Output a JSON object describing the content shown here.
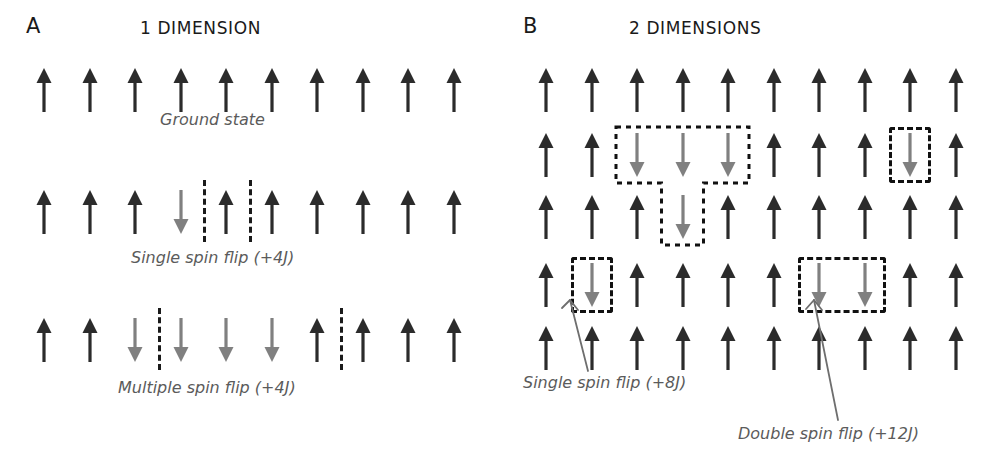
{
  "figure": {
    "type": "diagram",
    "background": "#ffffff",
    "colors": {
      "spin_up": "#2b2b2b",
      "spin_down": "#808080",
      "boundary": "#111111",
      "caption_text": "#5b5b5b",
      "title_text": "#1a1a1a",
      "leader_line": "#6e6e6e"
    }
  },
  "panels": [
    {
      "letter": "A",
      "title": "1 DIMENSION",
      "rows": [
        {
          "name": "ground-state",
          "caption": "Ground state",
          "spins": [
            "up",
            "up",
            "up",
            "up",
            "up",
            "up",
            "up",
            "up",
            "up",
            "up"
          ],
          "domain_walls": []
        },
        {
          "name": "single-spin-flip",
          "caption": "Single spin flip (+4J)",
          "spins": [
            "up",
            "up",
            "up",
            "down",
            "up",
            "up",
            "up",
            "up",
            "up",
            "up"
          ],
          "domain_walls": [
            3.5,
            4.5
          ]
        },
        {
          "name": "multiple-spin-flip",
          "caption": "Multiple spin flip (+4J)",
          "spins": [
            "up",
            "up",
            "down",
            "down",
            "down",
            "down",
            "up",
            "up",
            "up",
            "up"
          ],
          "domain_walls": [
            2.5,
            6.5
          ]
        }
      ]
    },
    {
      "letter": "B",
      "title": "2 DIMENSIONS",
      "grid": {
        "rows": 5,
        "cols": 10,
        "spins": [
          [
            "up",
            "up",
            "up",
            "up",
            "up",
            "up",
            "up",
            "up",
            "up",
            "up"
          ],
          [
            "up",
            "up",
            "down",
            "down",
            "down",
            "up",
            "up",
            "up",
            "down",
            "up"
          ],
          [
            "up",
            "up",
            "up",
            "down",
            "up",
            "up",
            "up",
            "up",
            "up",
            "up"
          ],
          [
            "up",
            "down",
            "up",
            "up",
            "up",
            "up",
            "down",
            "down",
            "up",
            "up"
          ],
          [
            "up",
            "up",
            "up",
            "up",
            "up",
            "up",
            "up",
            "up",
            "up",
            "up"
          ]
        ]
      },
      "clusters": [
        {
          "name": "t-shaped-cluster",
          "shape": "T",
          "cells": [
            [
              1,
              2
            ],
            [
              1,
              3
            ],
            [
              1,
              4
            ],
            [
              2,
              3
            ]
          ],
          "label": null
        },
        {
          "name": "single-flip-cluster-row2",
          "shape": "box",
          "cells": [
            [
              1,
              8
            ]
          ],
          "label": null
        },
        {
          "name": "single-flip-cluster-row4",
          "shape": "box",
          "cells": [
            [
              3,
              1
            ]
          ],
          "label": "Single spin flip (+8J)"
        },
        {
          "name": "double-flip-cluster-row4",
          "shape": "box",
          "cells": [
            [
              3,
              6
            ],
            [
              3,
              7
            ]
          ],
          "label": "Double spin flip (+12J)"
        }
      ],
      "annotations": [
        {
          "name": "single-spin-flip-annotation",
          "text": "Single spin flip (+8J)"
        },
        {
          "name": "double-spin-flip-annotation",
          "text": "Double spin flip (+12J)"
        }
      ]
    }
  ]
}
